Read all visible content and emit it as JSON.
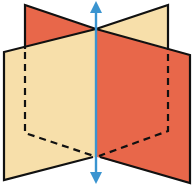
{
  "diagram": {
    "colors": {
      "plane_back": "#e8674a",
      "plane_front": "#f7dfaa",
      "edge": "#111111",
      "axis": "#3a94d0"
    },
    "planes": [
      {
        "name": "orange-plane",
        "color_key": "plane_back"
      },
      {
        "name": "cream-plane",
        "color_key": "plane_front"
      }
    ],
    "axis": {
      "orientation": "vertical",
      "arrows": "both-ends"
    }
  }
}
